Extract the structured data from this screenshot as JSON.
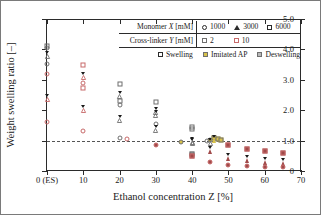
{
  "chart_data": {
    "type": "scatter",
    "title": "",
    "xlabel": "Ethanol concentration Z [%]",
    "ylabel": "Weight swelling ratio [–]",
    "xlim": [
      0,
      70
    ],
    "ylim": [
      0,
      5.0
    ],
    "xticks": [
      0,
      10,
      20,
      30,
      40,
      50,
      60,
      70
    ],
    "xtick_labels": [
      "0 (ES)",
      "10",
      "20",
      "30",
      "40",
      "50",
      "60",
      "70"
    ],
    "yticks": [
      0,
      1.0,
      2.0,
      3.0,
      4.0,
      5.0
    ],
    "ytick_labels": [
      "0",
      "1.0",
      "2.0",
      "3.0",
      "4.0",
      "5.0"
    ],
    "grid": false,
    "reference_line": {
      "y": 1.0,
      "style": "dashed",
      "color": "#555555"
    },
    "legend_position": "top-right-inside",
    "colors": {
      "crosslinker_2": "#6f6f6f",
      "crosslinker_10": "#c76a6a",
      "imitated_ap_fill": "#d8c24a",
      "deswelling_fill_gray": "#9a9a9a",
      "deswelling_fill_red": "#a14a4a",
      "axis": "#2b2b2b",
      "refline": "#555555"
    },
    "points": [
      {
        "x": 0,
        "y": 4.1,
        "shape": "square",
        "series": "crosslinker_2",
        "state": "swelling"
      },
      {
        "x": 0,
        "y": 4.05,
        "shape": "circle",
        "series": "crosslinker_2",
        "state": "swelling"
      },
      {
        "x": 0,
        "y": 3.8,
        "shape": "triangle",
        "series": "crosslinker_2",
        "state": "swelling"
      },
      {
        "x": 0,
        "y": 3.52,
        "shape": "circle",
        "series": "crosslinker_2",
        "state": "swelling"
      },
      {
        "x": 0,
        "y": 3.2,
        "shape": "circle",
        "series": "crosslinker_10",
        "state": "swelling"
      },
      {
        "x": 0,
        "y": 2.4,
        "shape": "triangle",
        "series": "crosslinker_10",
        "state": "swelling"
      },
      {
        "x": 0,
        "y": 1.6,
        "shape": "circle",
        "series": "crosslinker_10",
        "state": "swelling"
      },
      {
        "x": 10,
        "y": 3.5,
        "shape": "square",
        "series": "crosslinker_10",
        "state": "swelling"
      },
      {
        "x": 10,
        "y": 3.12,
        "shape": "triangle",
        "series": "crosslinker_10",
        "state": "swelling"
      },
      {
        "x": 10,
        "y": 2.9,
        "shape": "circle",
        "series": "crosslinker_10",
        "state": "swelling"
      },
      {
        "x": 10,
        "y": 2.72,
        "shape": "square",
        "series": "crosslinker_10",
        "state": "swelling"
      },
      {
        "x": 10,
        "y": 2.05,
        "shape": "triangle",
        "series": "crosslinker_10",
        "state": "swelling"
      },
      {
        "x": 10,
        "y": 1.33,
        "shape": "circle",
        "series": "crosslinker_10",
        "state": "swelling"
      },
      {
        "x": 20,
        "y": 2.85,
        "shape": "square",
        "series": "crosslinker_2",
        "state": "swelling"
      },
      {
        "x": 20,
        "y": 2.5,
        "shape": "triangle",
        "series": "crosslinker_2",
        "state": "swelling"
      },
      {
        "x": 20,
        "y": 2.3,
        "shape": "square",
        "series": "crosslinker_2",
        "state": "swelling"
      },
      {
        "x": 20,
        "y": 2.18,
        "shape": "circle",
        "series": "crosslinker_2",
        "state": "swelling"
      },
      {
        "x": 20,
        "y": 1.7,
        "shape": "triangle",
        "series": "crosslinker_2",
        "state": "swelling"
      },
      {
        "x": 20,
        "y": 1.08,
        "shape": "circle",
        "series": "crosslinker_2",
        "state": "swelling"
      },
      {
        "x": 22,
        "y": 1.06,
        "shape": "circle",
        "series": "crosslinker_10",
        "state": "swelling"
      },
      {
        "x": 30,
        "y": 2.28,
        "shape": "square",
        "series": "crosslinker_2",
        "state": "swelling"
      },
      {
        "x": 30,
        "y": 1.98,
        "shape": "triangle",
        "series": "crosslinker_2",
        "state": "swelling"
      },
      {
        "x": 30,
        "y": 1.88,
        "shape": "triangle",
        "series": "crosslinker_2",
        "state": "swelling"
      },
      {
        "x": 30,
        "y": 1.56,
        "shape": "circle",
        "series": "crosslinker_2",
        "state": "swelling"
      },
      {
        "x": 30,
        "y": 1.38,
        "shape": "triangle",
        "series": "crosslinker_2",
        "state": "swelling"
      },
      {
        "x": 30,
        "y": 0.84,
        "shape": "circle",
        "series": "crosslinker_10",
        "state": "deswelling"
      },
      {
        "x": 37,
        "y": 0.97,
        "shape": "circle",
        "series": "imitated_ap",
        "state": "imitated_ap"
      },
      {
        "x": 40,
        "y": 1.44,
        "shape": "square",
        "series": "crosslinker_2",
        "state": "swelling"
      },
      {
        "x": 40,
        "y": 1.38,
        "shape": "square",
        "series": "crosslinker_2",
        "state": "swelling"
      },
      {
        "x": 40,
        "y": 1.0,
        "shape": "triangle",
        "series": "crosslinker_2",
        "state": "swelling"
      },
      {
        "x": 40,
        "y": 0.95,
        "shape": "triangle",
        "series": "crosslinker_2",
        "state": "swelling"
      },
      {
        "x": 40,
        "y": 0.57,
        "shape": "square",
        "series": "crosslinker_2",
        "state": "deswelling"
      },
      {
        "x": 40,
        "y": 0.5,
        "shape": "square",
        "series": "crosslinker_10",
        "state": "deswelling"
      },
      {
        "x": 44,
        "y": 0.98,
        "shape": "circle",
        "series": "crosslinker_2",
        "state": "swelling"
      },
      {
        "x": 45,
        "y": 1.02,
        "shape": "circle",
        "series": "imitated_ap",
        "state": "imitated_ap"
      },
      {
        "x": 45,
        "y": 0.96,
        "shape": "triangle",
        "series": "crosslinker_2",
        "state": "swelling"
      },
      {
        "x": 45,
        "y": 0.7,
        "shape": "triangle",
        "series": "crosslinker_10",
        "state": "deswelling"
      },
      {
        "x": 45,
        "y": 0.3,
        "shape": "circle",
        "series": "crosslinker_10",
        "state": "deswelling"
      },
      {
        "x": 46,
        "y": 1.08,
        "shape": "square",
        "series": "imitated_ap",
        "state": "imitated_ap"
      },
      {
        "x": 46,
        "y": 1.05,
        "shape": "triangle",
        "series": "imitated_ap",
        "state": "imitated_ap"
      },
      {
        "x": 47,
        "y": 1.04,
        "shape": "square",
        "series": "imitated_ap",
        "state": "imitated_ap"
      },
      {
        "x": 48,
        "y": 1.03,
        "shape": "square",
        "series": "imitated_ap",
        "state": "imitated_ap"
      },
      {
        "x": 50,
        "y": 0.87,
        "shape": "square",
        "series": "crosslinker_10",
        "state": "deswelling"
      },
      {
        "x": 50,
        "y": 0.47,
        "shape": "triangle",
        "series": "crosslinker_10",
        "state": "deswelling"
      },
      {
        "x": 50,
        "y": 0.2,
        "shape": "circle",
        "series": "crosslinker_10",
        "state": "deswelling"
      },
      {
        "x": 55,
        "y": 0.73,
        "shape": "square",
        "series": "crosslinker_10",
        "state": "deswelling"
      },
      {
        "x": 55,
        "y": 0.4,
        "shape": "triangle",
        "series": "crosslinker_10",
        "state": "deswelling"
      },
      {
        "x": 55,
        "y": 0.18,
        "shape": "circle",
        "series": "crosslinker_10",
        "state": "deswelling"
      },
      {
        "x": 60,
        "y": 0.66,
        "shape": "square",
        "series": "crosslinker_10",
        "state": "deswelling"
      },
      {
        "x": 60,
        "y": 0.33,
        "shape": "triangle",
        "series": "crosslinker_10",
        "state": "deswelling"
      },
      {
        "x": 60,
        "y": 0.14,
        "shape": "circle",
        "series": "crosslinker_10",
        "state": "deswelling"
      },
      {
        "x": 65,
        "y": 0.6,
        "shape": "square",
        "series": "crosslinker_10",
        "state": "deswelling"
      },
      {
        "x": 65,
        "y": 0.28,
        "shape": "triangle",
        "series": "crosslinker_10",
        "state": "deswelling"
      },
      {
        "x": 65,
        "y": 0.14,
        "shape": "circle",
        "series": "crosslinker_10",
        "state": "deswelling"
      }
    ]
  },
  "legend": {
    "row1": {
      "header_prefix": "Monomer ",
      "header_var": "X",
      "header_suffix": " [mM]",
      "items": [
        {
          "shape": "circle",
          "label": "1000"
        },
        {
          "shape": "triangle",
          "label": "3000"
        },
        {
          "shape": "square",
          "label": "6000"
        }
      ]
    },
    "row2": {
      "header_prefix": "Cross-linker ",
      "header_var": "Y",
      "header_suffix": " [mM]",
      "items": [
        {
          "shape": "square",
          "label": "2",
          "color": "#6f6f6f"
        },
        {
          "shape": "square",
          "label": "10",
          "color": "#c76a6a"
        }
      ]
    },
    "row3": {
      "items": [
        {
          "shape": "square",
          "label": "Swelling",
          "fill": "none"
        },
        {
          "shape": "square",
          "label": "Imitated AP",
          "fill": "#d8c24a"
        },
        {
          "shape": "square",
          "label": "Deswelling",
          "fill": "#9a9a9a"
        }
      ]
    }
  },
  "axes": {
    "ylabel_text": "Weight swelling ratio [–]",
    "xlabel_text": "Ethanol concentration Z [%]"
  }
}
